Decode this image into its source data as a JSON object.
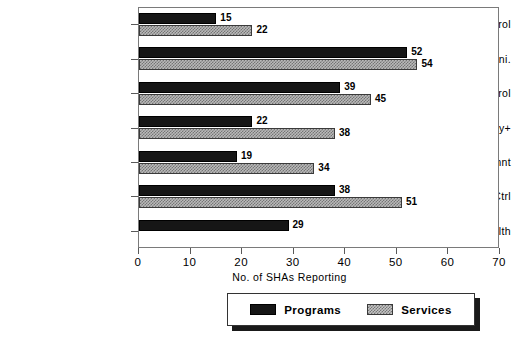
{
  "chart_data": {
    "type": "bar",
    "orientation": "horizontal",
    "title": "",
    "xlabel": "No. of SHAs Reporting",
    "ylabel": "",
    "xlim": [
      0,
      70
    ],
    "xticks": [
      0,
      10,
      20,
      30,
      40,
      50,
      60,
      70
    ],
    "grid": false,
    "legend_position": "bottom-center",
    "categories": [
      "Air Quality Control",
      "Cons.Prot. & Sani.",
      "Radiation Control",
      "Occ Hlth & Safety+",
      "Waste Mangmnt",
      "Water Qual Ctrl",
      "Genl.Env. Health"
    ],
    "series": [
      {
        "name": "Programs",
        "color": "#161616",
        "pattern": "solid",
        "values": [
          15,
          52,
          39,
          22,
          19,
          38,
          29
        ]
      },
      {
        "name": "Services",
        "color": "#b9b9b9",
        "pattern": "crosshatch",
        "values": [
          22,
          54,
          45,
          38,
          34,
          51,
          null
        ]
      }
    ]
  },
  "axis": {
    "tick_labels": [
      "0",
      "10",
      "20",
      "30",
      "40",
      "50",
      "60",
      "70"
    ],
    "title": "No. of SHAs Reporting"
  },
  "legend": {
    "items": [
      {
        "label": "Programs",
        "swatch": "solid-black-swatch"
      },
      {
        "label": "Services",
        "swatch": "crosshatch-gray-swatch"
      }
    ]
  }
}
